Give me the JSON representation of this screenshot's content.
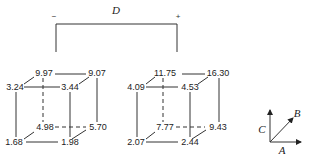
{
  "factor_bracket": {
    "label": "D",
    "minus_label": "−",
    "plus_label": "+"
  },
  "cubes": [
    {
      "name": "D-minus",
      "vertices": {
        "front_top_left": "3.24",
        "front_top_right": "3.44",
        "back_top_left": "9.97",
        "back_top_right": "9.07",
        "front_bottom_left": "1.68",
        "front_bottom_right": "1.98",
        "back_bottom_left": "4.98",
        "back_bottom_right": "5.70"
      }
    },
    {
      "name": "D-plus",
      "vertices": {
        "front_top_left": "4.09",
        "front_top_right": "4.53",
        "back_top_left": "11.75",
        "back_top_right": "16.30",
        "front_bottom_left": "2.07",
        "front_bottom_right": "2.44",
        "back_bottom_left": "7.77",
        "back_bottom_right": "9.43"
      }
    }
  ],
  "axes": {
    "a_label": "A",
    "b_label": "B",
    "c_label": "C"
  }
}
